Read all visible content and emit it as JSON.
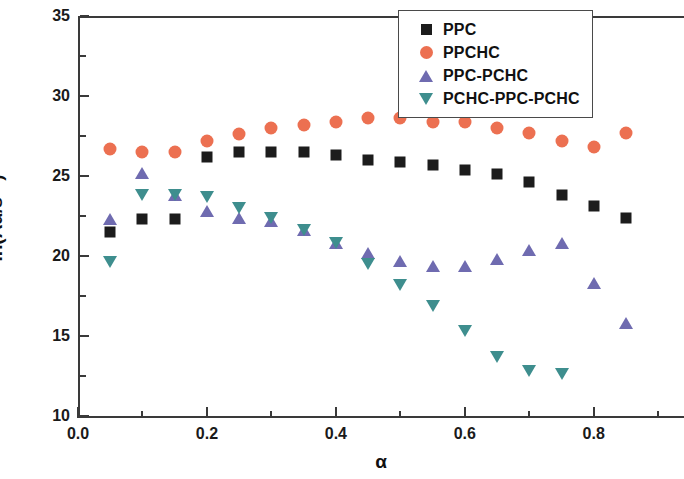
{
  "chart_data": {
    "type": "scatter",
    "title": "",
    "xlabel": "α",
    "ylabel": "ln(Aα/s⁻¹)",
    "xlim": [
      0.0,
      0.94
    ],
    "ylim": [
      10,
      35
    ],
    "grid": false,
    "legend_position": "top-right",
    "x_ticks_major": [
      "0.0",
      "0.2",
      "0.4",
      "0.6",
      "0.8"
    ],
    "x_tick_values_major": [
      0.0,
      0.2,
      0.4,
      0.6,
      0.8
    ],
    "x_tick_values_minor": [
      0.1,
      0.3,
      0.5,
      0.7,
      0.9
    ],
    "y_ticks_major": [
      "10",
      "15",
      "20",
      "25",
      "30",
      "35"
    ],
    "y_tick_values_major": [
      10,
      15,
      20,
      25,
      30,
      35
    ],
    "y_tick_values_minor": [
      12.5,
      17.5,
      22.5,
      27.5,
      32.5
    ],
    "series": [
      {
        "name": "PPC",
        "marker": "square",
        "color": "#1c1c1c",
        "x": [
          0.05,
          0.1,
          0.15,
          0.2,
          0.25,
          0.3,
          0.35,
          0.4,
          0.45,
          0.5,
          0.55,
          0.6,
          0.65,
          0.7,
          0.75,
          0.8,
          0.85
        ],
        "values": [
          21.5,
          22.3,
          22.3,
          26.2,
          26.5,
          26.5,
          26.5,
          26.3,
          26.0,
          25.9,
          25.7,
          25.4,
          25.1,
          24.6,
          23.8,
          23.1,
          22.4
        ]
      },
      {
        "name": "PPCHC",
        "marker": "circle",
        "color": "#ec7051",
        "x": [
          0.05,
          0.1,
          0.15,
          0.2,
          0.25,
          0.3,
          0.35,
          0.4,
          0.45,
          0.5,
          0.55,
          0.6,
          0.65,
          0.7,
          0.75,
          0.8,
          0.85
        ],
        "values": [
          26.7,
          26.5,
          26.5,
          27.2,
          27.6,
          28.0,
          28.2,
          28.4,
          28.6,
          28.6,
          28.4,
          28.4,
          28.0,
          27.7,
          27.2,
          26.8,
          27.7
        ]
      },
      {
        "name": "PPC-PCHC",
        "marker": "triangle-up",
        "color": "#6f6bb0",
        "x": [
          0.05,
          0.1,
          0.15,
          0.2,
          0.25,
          0.3,
          0.35,
          0.4,
          0.45,
          0.5,
          0.55,
          0.6,
          0.65,
          0.7,
          0.75,
          0.8,
          0.85
        ],
        "values": [
          22.3,
          25.2,
          23.8,
          22.8,
          22.4,
          22.2,
          21.6,
          20.8,
          20.2,
          19.7,
          19.4,
          19.4,
          19.8,
          20.4,
          20.8,
          18.3,
          15.8
        ]
      },
      {
        "name": "PCHC-PPC-PCHC",
        "marker": "triangle-down",
        "color": "#3e8e8e",
        "x": [
          0.05,
          0.1,
          0.15,
          0.2,
          0.25,
          0.3,
          0.35,
          0.4,
          0.45,
          0.5,
          0.55,
          0.6,
          0.65,
          0.7,
          0.75
        ],
        "values": [
          19.6,
          23.8,
          23.8,
          23.7,
          23.0,
          22.4,
          21.6,
          20.8,
          19.5,
          18.2,
          16.9,
          15.3,
          13.7,
          12.8,
          12.6
        ]
      }
    ]
  },
  "legend": {
    "items": [
      {
        "label": "PPC"
      },
      {
        "label": "PPCHC"
      },
      {
        "label": "PPC-PCHC"
      },
      {
        "label": "PCHC-PPC-PCHC"
      }
    ]
  }
}
